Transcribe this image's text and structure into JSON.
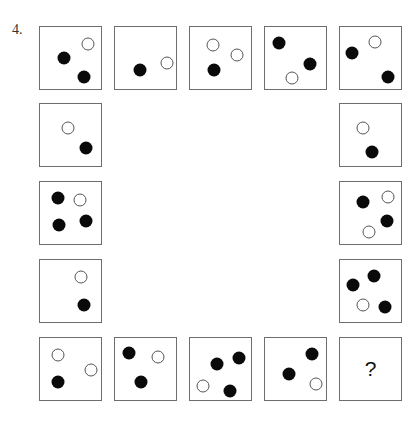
{
  "question_number": "4.",
  "colors": {
    "black_dot": "#0a0a0a",
    "white_dot_border": "#555555",
    "box_border": "#6e6e6e"
  },
  "boxes": [
    {
      "id": "r1c1",
      "x": 39,
      "y": 26,
      "dots": [
        {
          "type": "white",
          "x": 48,
          "y": 17
        },
        {
          "type": "black",
          "x": 24,
          "y": 31
        },
        {
          "type": "black",
          "x": 44,
          "y": 50
        }
      ]
    },
    {
      "id": "r1c2",
      "x": 114,
      "y": 26,
      "dots": [
        {
          "type": "black",
          "x": 25,
          "y": 43
        },
        {
          "type": "white",
          "x": 52,
          "y": 36
        }
      ]
    },
    {
      "id": "r1c3",
      "x": 189,
      "y": 26,
      "dots": [
        {
          "type": "white",
          "x": 23,
          "y": 18
        },
        {
          "type": "white",
          "x": 47,
          "y": 28
        },
        {
          "type": "black",
          "x": 24,
          "y": 43
        }
      ]
    },
    {
      "id": "r1c4",
      "x": 264,
      "y": 26,
      "dots": [
        {
          "type": "black",
          "x": 14,
          "y": 16
        },
        {
          "type": "black",
          "x": 45,
          "y": 37
        },
        {
          "type": "white",
          "x": 27,
          "y": 51
        }
      ]
    },
    {
      "id": "r1c5",
      "x": 339,
      "y": 26,
      "dots": [
        {
          "type": "black",
          "x": 12,
          "y": 26
        },
        {
          "type": "white",
          "x": 35,
          "y": 15
        },
        {
          "type": "black",
          "x": 48,
          "y": 50
        }
      ]
    },
    {
      "id": "r2c1",
      "x": 39,
      "y": 103,
      "dots": [
        {
          "type": "white",
          "x": 28,
          "y": 24
        },
        {
          "type": "black",
          "x": 46,
          "y": 44
        }
      ]
    },
    {
      "id": "r2c5",
      "x": 339,
      "y": 103,
      "dots": [
        {
          "type": "white",
          "x": 23,
          "y": 24
        },
        {
          "type": "black",
          "x": 32,
          "y": 48
        }
      ]
    },
    {
      "id": "r3c1",
      "x": 39,
      "y": 181,
      "dots": [
        {
          "type": "black",
          "x": 18,
          "y": 16
        },
        {
          "type": "white",
          "x": 40,
          "y": 18
        },
        {
          "type": "black",
          "x": 19,
          "y": 43
        },
        {
          "type": "black",
          "x": 46,
          "y": 39
        }
      ]
    },
    {
      "id": "r3c5",
      "x": 339,
      "y": 181,
      "dots": [
        {
          "type": "black",
          "x": 23,
          "y": 20
        },
        {
          "type": "white",
          "x": 48,
          "y": 15
        },
        {
          "type": "black",
          "x": 47,
          "y": 39
        },
        {
          "type": "white",
          "x": 29,
          "y": 50
        }
      ]
    },
    {
      "id": "r4c1",
      "x": 39,
      "y": 259,
      "dots": [
        {
          "type": "white",
          "x": 41,
          "y": 17
        },
        {
          "type": "black",
          "x": 44,
          "y": 45
        }
      ]
    },
    {
      "id": "r4c5",
      "x": 339,
      "y": 259,
      "dots": [
        {
          "type": "black",
          "x": 34,
          "y": 16
        },
        {
          "type": "black",
          "x": 13,
          "y": 25
        },
        {
          "type": "white",
          "x": 23,
          "y": 45
        },
        {
          "type": "black",
          "x": 45,
          "y": 47
        }
      ]
    },
    {
      "id": "r5c1",
      "x": 39,
      "y": 337,
      "dots": [
        {
          "type": "white",
          "x": 18,
          "y": 17
        },
        {
          "type": "white",
          "x": 51,
          "y": 32
        },
        {
          "type": "black",
          "x": 18,
          "y": 44
        }
      ]
    },
    {
      "id": "r5c2",
      "x": 114,
      "y": 337,
      "dots": [
        {
          "type": "black",
          "x": 14,
          "y": 15
        },
        {
          "type": "white",
          "x": 43,
          "y": 19
        },
        {
          "type": "black",
          "x": 26,
          "y": 44
        }
      ]
    },
    {
      "id": "r5c3",
      "x": 189,
      "y": 337,
      "dots": [
        {
          "type": "black",
          "x": 27,
          "y": 26
        },
        {
          "type": "black",
          "x": 49,
          "y": 20
        },
        {
          "type": "white",
          "x": 13,
          "y": 48
        },
        {
          "type": "black",
          "x": 40,
          "y": 53
        }
      ]
    },
    {
      "id": "r5c4",
      "x": 264,
      "y": 337,
      "dots": [
        {
          "type": "black",
          "x": 47,
          "y": 16
        },
        {
          "type": "black",
          "x": 24,
          "y": 36
        },
        {
          "type": "white",
          "x": 51,
          "y": 46
        }
      ]
    },
    {
      "id": "r5c5",
      "x": 339,
      "y": 337,
      "dots": [],
      "label": "?"
    }
  ]
}
